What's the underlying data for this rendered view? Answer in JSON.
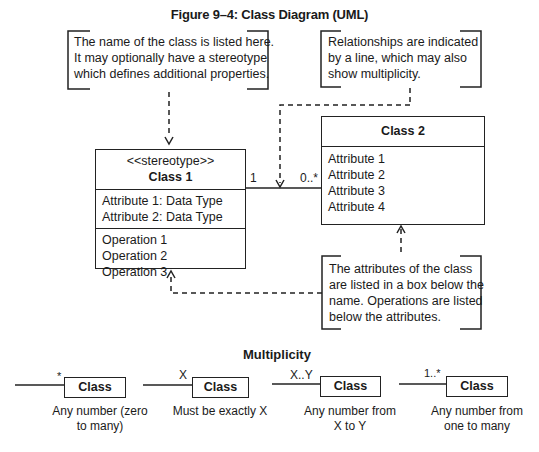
{
  "title": "Figure 9–4: Class Diagram (UML)",
  "notes": {
    "class_name": [
      "The name of the class is listed here.",
      "It may optionally have a stereotype",
      "which defines additional properties."
    ],
    "relationships": [
      "Relationships are indicated",
      "by a line, which may also",
      "show multiplicity."
    ],
    "attributes": [
      "The attributes of the class",
      "are listed in a box below the",
      "name. Operations are listed",
      "below the attributes."
    ]
  },
  "class1": {
    "stereotype": "<<stereotype>>",
    "name": "Class 1",
    "attributes": [
      "Attribute 1: Data Type",
      "Attribute 2: Data Type"
    ],
    "operations": [
      "Operation 1",
      "Operation 2",
      "Operation 3"
    ]
  },
  "class2": {
    "name": "Class 2",
    "attributes": [
      "Attribute 1",
      "Attribute 2",
      "Attribute 3",
      "Attribute 4"
    ]
  },
  "association": {
    "left_mult": "1",
    "right_mult": "0..*"
  },
  "multiplicity": {
    "heading": "Multiplicity",
    "items": [
      {
        "label": "*",
        "box": "Class",
        "desc": [
          "Any number (zero",
          "to many)"
        ]
      },
      {
        "label": "X",
        "box": "Class",
        "desc": [
          "Must be exactly X"
        ]
      },
      {
        "label": "X..Y",
        "box": "Class",
        "desc": [
          "Any number from",
          "X to Y"
        ]
      },
      {
        "label": "1..*",
        "box": "Class",
        "desc": [
          "Any number from",
          "one to many"
        ]
      }
    ]
  }
}
